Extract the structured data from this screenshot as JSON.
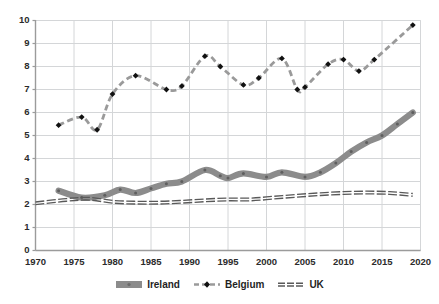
{
  "chart_data": {
    "type": "line",
    "title": "",
    "xlabel": "",
    "ylabel": "",
    "xlim": [
      1970,
      2020
    ],
    "ylim": [
      0,
      10
    ],
    "grid": true,
    "legend_position": "bottom",
    "x_ticks": [
      "1970",
      "1975",
      "1980",
      "1985",
      "1990",
      "1995",
      "2000",
      "2005",
      "2010",
      "2015",
      "2020"
    ],
    "y_ticks": [
      "0",
      "1",
      "2",
      "3",
      "4",
      "5",
      "6",
      "7",
      "8",
      "9",
      "10"
    ],
    "series": [
      {
        "name": "Ireland",
        "color": "#8c8c8c",
        "style": "solid-thick",
        "marker": "small-dot",
        "x": [
          1973,
          1976,
          1979,
          1981,
          1983,
          1985,
          1987,
          1989,
          1992,
          1994,
          1995,
          1997,
          2000,
          2002,
          2005,
          2007,
          2009,
          2011,
          2013,
          2015,
          2017,
          2019
        ],
        "values": [
          2.6,
          2.3,
          2.4,
          2.65,
          2.5,
          2.7,
          2.9,
          3.0,
          3.5,
          3.25,
          3.15,
          3.35,
          3.2,
          3.4,
          3.2,
          3.4,
          3.8,
          4.3,
          4.7,
          5.0,
          5.5,
          6.0
        ]
      },
      {
        "name": "Belgium",
        "color": "#9a9a9a",
        "marker_color": "#111111",
        "style": "dashed",
        "marker": "diamond",
        "x": [
          1973,
          1976,
          1978,
          1980,
          1983,
          1987,
          1989,
          1992,
          1994,
          1997,
          1999,
          2002,
          2004,
          2005,
          2008,
          2010,
          2012,
          2014,
          2019
        ],
        "values": [
          5.45,
          5.8,
          5.25,
          6.8,
          7.6,
          7.0,
          7.15,
          8.45,
          8.0,
          7.2,
          7.5,
          8.35,
          7.0,
          7.1,
          8.1,
          8.3,
          7.8,
          8.3,
          9.8
        ]
      },
      {
        "name": "UK",
        "color": "#595959",
        "style": "solid-thin-double",
        "marker": "none",
        "x": [
          1970,
          1974,
          1977,
          1980,
          1983,
          1986,
          1989,
          1992,
          1995,
          1998,
          2001,
          2004,
          2007,
          2010,
          2013,
          2016,
          2019
        ],
        "values": [
          2.05,
          2.2,
          2.25,
          2.12,
          2.08,
          2.08,
          2.12,
          2.18,
          2.22,
          2.22,
          2.3,
          2.38,
          2.45,
          2.5,
          2.52,
          2.5,
          2.42
        ]
      }
    ]
  },
  "legend": {
    "items": [
      {
        "label": "Ireland"
      },
      {
        "label": "Belgium"
      },
      {
        "label": "UK"
      }
    ]
  },
  "colors": {
    "ireland": "#8c8c8c",
    "belgium": "#9a9a9a",
    "belgium_marker": "#111111",
    "uk": "#595959",
    "grid": "#d4d6d8",
    "axis": "#9b9b9b",
    "text": "#2b2b2b",
    "background": "#ffffff"
  }
}
